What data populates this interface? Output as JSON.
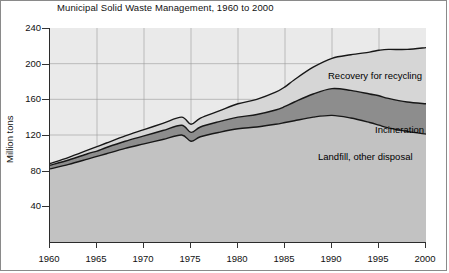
{
  "chart_data": {
    "type": "area",
    "title": "Municipal Solid Waste Management, 1960 to 2000",
    "xlabel": "",
    "ylabel": "Million tons",
    "xlim": [
      1960,
      2000
    ],
    "ylim": [
      0,
      240
    ],
    "grid": true,
    "legend_position": "inline-annotations",
    "stacked": true,
    "xticks": [
      "1960",
      "1965",
      "1970",
      "1975",
      "1980",
      "1985",
      "1990",
      "1995",
      "2000"
    ],
    "yticks": [
      "40",
      "80",
      "120",
      "160",
      "200",
      "240"
    ],
    "x": [
      1960,
      1962,
      1964,
      1965,
      1966,
      1968,
      1970,
      1972,
      1974,
      1975,
      1976,
      1978,
      1980,
      1982,
      1984,
      1985,
      1986,
      1988,
      1990,
      1992,
      1994,
      1995,
      1996,
      1998,
      2000
    ],
    "series": [
      {
        "name": "Landfill, other disposal",
        "color": "#c2c2c2",
        "values": [
          82,
          87,
          93,
          96,
          99,
          105,
          110,
          115,
          120,
          113,
          118,
          123,
          127,
          129,
          132,
          134,
          136,
          140,
          142,
          139,
          134,
          131,
          128,
          124,
          121
        ]
      },
      {
        "name": "Incineration",
        "color": "#8d8d8d",
        "values": [
          4,
          5,
          6,
          6,
          7,
          8,
          9,
          10,
          11,
          10,
          11,
          12,
          13,
          14,
          16,
          18,
          21,
          26,
          30,
          31,
          32,
          33,
          33,
          33,
          34
        ]
      },
      {
        "name": "Recovery for recycling",
        "color": "#d6d6d6",
        "values": [
          2,
          3,
          4,
          5,
          5,
          6,
          7,
          8,
          9,
          9,
          10,
          12,
          15,
          17,
          20,
          22,
          25,
          30,
          34,
          40,
          47,
          51,
          55,
          59,
          63
        ]
      }
    ],
    "totals": [
      88,
      95,
      103,
      107,
      111,
      119,
      126,
      133,
      140,
      132,
      139,
      147,
      155,
      160,
      168,
      174,
      182,
      196,
      206,
      210,
      213,
      215,
      216,
      216,
      218
    ],
    "annotations": [
      {
        "key": "recovery",
        "text": "Recovery for recycling"
      },
      {
        "key": "incineration",
        "text": "Incineration"
      },
      {
        "key": "landfill",
        "text": "Landfill, other disposal"
      }
    ]
  }
}
